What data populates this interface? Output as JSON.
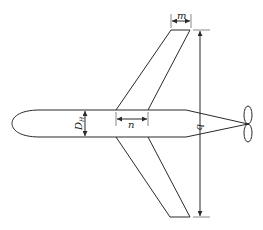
{
  "diagram": {
    "labels": {
      "m": "m",
      "n": "n",
      "b": "b",
      "dh_main": "D",
      "dh_sub": "H"
    },
    "components": [
      "fuselage",
      "upper-wing",
      "lower-wing",
      "tail-cone",
      "propeller"
    ],
    "dimensions": [
      {
        "name": "m",
        "meaning": "wing tip chord"
      },
      {
        "name": "n",
        "meaning": "wing root chord"
      },
      {
        "name": "b",
        "meaning": "wing span"
      },
      {
        "name": "D_H",
        "meaning": "fuselage diameter"
      }
    ],
    "colors": {
      "stroke": "#2a2a2a",
      "background": "#ffffff"
    }
  }
}
